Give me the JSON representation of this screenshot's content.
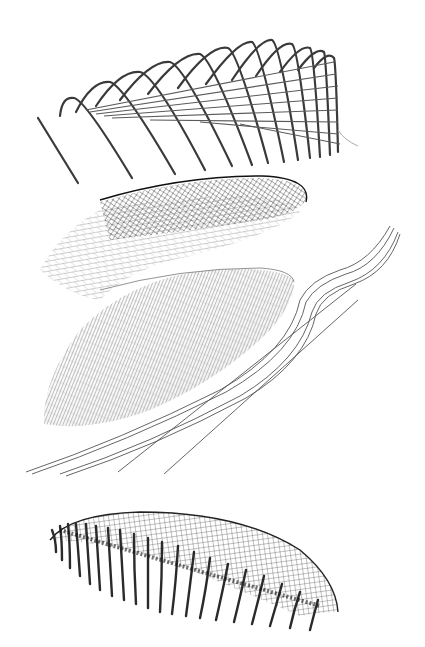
{
  "diagram": {
    "type": "exploded-axonometric",
    "background": "#ffffff",
    "layers": [
      {
        "id": "arch-ribs",
        "description": "Arched structural ribs with horizontal purlins",
        "color": "#333333",
        "rib_count": 14
      },
      {
        "id": "diagrid-shell",
        "description": "Dense triangulated lattice shell",
        "color": "#222222"
      },
      {
        "id": "membrane-skin",
        "description": "Grey gridded cladding surface",
        "color": "#9a9a9a"
      },
      {
        "id": "ground-curves",
        "description": "Site / ground contour lines",
        "color": "#444444",
        "line_count": 6
      },
      {
        "id": "assembled-structure",
        "description": "Assembled roof with columns and gridshell",
        "color": "#2a2a2a",
        "column_count": 20
      }
    ]
  }
}
